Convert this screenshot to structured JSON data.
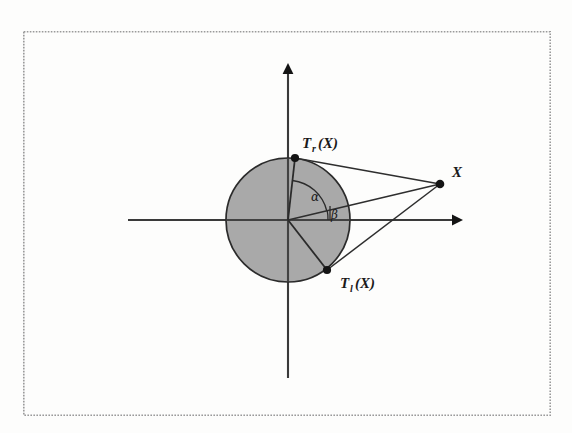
{
  "figure": {
    "background_color": "#fdfdfc",
    "frame": {
      "name": "figure-border",
      "x": 23,
      "y": 31,
      "width": 528,
      "height": 385,
      "style": "dotted",
      "color": "#9a9a9a"
    },
    "axes": {
      "origin": {
        "x": 288,
        "y": 220
      },
      "horizontal": {
        "x1": 128,
        "y1": 220,
        "x2": 462,
        "y2": 220,
        "arrow": "right"
      },
      "vertical": {
        "x1": 288,
        "y1": 378,
        "x2": 288,
        "y2": 64,
        "arrow": "up"
      },
      "color": "#3a3a3a"
    },
    "circle": {
      "name": "shaded-disc",
      "cx": 288,
      "cy": 220,
      "r": 62,
      "fill": "#a9a9a9",
      "stroke": "#2b2b2b"
    },
    "points": [
      {
        "id": "Tr",
        "label": "T",
        "subscript": "r",
        "suffix": "(X)",
        "x": 295,
        "y": 158,
        "label_x": 302,
        "label_y": 148
      },
      {
        "id": "Tl",
        "label": "T",
        "subscript": "l",
        "suffix": "(X)",
        "x": 327,
        "y": 270,
        "label_x": 338,
        "label_y": 288
      },
      {
        "id": "X",
        "label": "X",
        "subscript": "",
        "suffix": "",
        "x": 440,
        "y": 184,
        "label_x": 452,
        "label_y": 176
      }
    ],
    "segments": [
      {
        "name": "tangent-to-Tr",
        "from": "X",
        "to": "Tr"
      },
      {
        "name": "tangent-to-Tl",
        "from": "X",
        "to": "Tl"
      },
      {
        "name": "line-X-origin",
        "from": "X",
        "to": "origin"
      },
      {
        "name": "radius-to-Tr",
        "from": "origin",
        "to": "Tr"
      },
      {
        "name": "radius-to-Tl",
        "from": "origin",
        "to": "Tl"
      }
    ],
    "angles": [
      {
        "id": "alpha",
        "label": "α",
        "vertex": "origin",
        "arc_radius": 40,
        "label_x": 313,
        "label_y": 199,
        "between": [
          "radius-to-Tr",
          "line-X-origin"
        ]
      },
      {
        "id": "beta",
        "label": "β",
        "vertex": "origin",
        "arc_radius": 40,
        "label_x": 333,
        "label_y": 217,
        "between": [
          "line-X-origin",
          "positive-x-axis"
        ]
      }
    ],
    "labels": {
      "tangent_right": {
        "base": "T",
        "sub": "r",
        "tail": "(X)"
      },
      "tangent_left": {
        "base": "T",
        "sub": "l",
        "tail": "(X)"
      },
      "external_point": {
        "base": "X",
        "sub": "",
        "tail": ""
      },
      "angle_alpha": "α",
      "angle_beta": "β"
    }
  }
}
